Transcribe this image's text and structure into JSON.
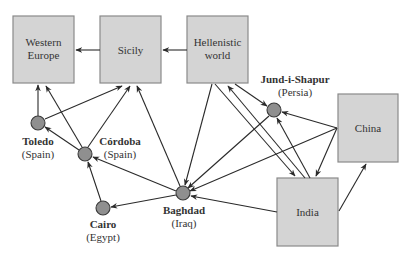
{
  "boxes": {
    "western_europe": {
      "line1": "Western",
      "line2": "Europe",
      "x": 13,
      "y": 16,
      "w": 61,
      "h": 67
    },
    "sicily": {
      "label": "Sicily",
      "x": 100,
      "y": 16,
      "w": 61,
      "h": 67
    },
    "hellenistic": {
      "line1": "Hellenistic",
      "line2": "world",
      "x": 187,
      "y": 16,
      "w": 61,
      "h": 67
    },
    "china": {
      "label": "China",
      "x": 338,
      "y": 94,
      "w": 60,
      "h": 68
    },
    "india": {
      "label": "India",
      "x": 277,
      "y": 178,
      "w": 61,
      "h": 68
    }
  },
  "hubs": {
    "toledo": {
      "name": "Toledo",
      "region": "(Spain)",
      "cx": 38,
      "cy": 123
    },
    "cordoba": {
      "name": "Córdoba",
      "region": "(Spain)",
      "cx": 85,
      "cy": 154
    },
    "cairo": {
      "name": "Cairo",
      "region": "(Egypt)",
      "cx": 103,
      "cy": 208
    },
    "baghdad": {
      "name": "Baghdad",
      "region": "(Iraq)",
      "cx": 183,
      "cy": 193
    },
    "jund": {
      "name": "Jund-i-Shapur",
      "region": "(Persia)",
      "cx": 274,
      "cy": 110
    }
  },
  "edges": [
    {
      "from": "Hellenistic world",
      "to": "Sicily",
      "x1": 187,
      "y1": 50,
      "x2": 163,
      "y2": 50
    },
    {
      "from": "Sicily",
      "to": "Western Europe",
      "x1": 100,
      "y1": 50,
      "x2": 76,
      "y2": 50
    },
    {
      "from": "Toledo",
      "to": "Western Europe",
      "x1": 38,
      "y1": 116,
      "x2": 38,
      "y2": 85
    },
    {
      "from": "Toledo",
      "to": "Sicily",
      "x1": 45,
      "y1": 119,
      "x2": 122,
      "y2": 86
    },
    {
      "from": "Córdoba",
      "to": "Western Europe",
      "x1": 82,
      "y1": 147,
      "x2": 46,
      "y2": 86
    },
    {
      "from": "Córdoba",
      "to": "Toledo",
      "x1": 79,
      "y1": 150,
      "x2": 45,
      "y2": 127
    },
    {
      "from": "Córdoba",
      "to": "Sicily",
      "x1": 88,
      "y1": 147,
      "x2": 130,
      "y2": 86
    },
    {
      "from": "Cairo",
      "to": "Córdoba",
      "x1": 101,
      "y1": 201,
      "x2": 88,
      "y2": 162
    },
    {
      "from": "Baghdad",
      "to": "Córdoba",
      "x1": 176,
      "y1": 191,
      "x2": 93,
      "y2": 157
    },
    {
      "from": "Baghdad",
      "to": "Cairo",
      "x1": 176,
      "y1": 195,
      "x2": 111,
      "y2": 207
    },
    {
      "from": "Baghdad",
      "to": "Sicily",
      "x1": 180,
      "y1": 186,
      "x2": 137,
      "y2": 86
    },
    {
      "from": "Hellenistic world",
      "to": "Baghdad",
      "x1": 212,
      "y1": 84,
      "x2": 185,
      "y2": 185
    },
    {
      "from": "Hellenistic world",
      "to": "Jund-i-Shapur",
      "x1": 235,
      "y1": 84,
      "x2": 267,
      "y2": 106
    },
    {
      "from": "Hellenistic world",
      "to": "India",
      "x1": 215,
      "y1": 84,
      "x2": 295,
      "y2": 176
    },
    {
      "from": "India",
      "to": "Hellenistic world",
      "x1": 305,
      "y1": 178,
      "x2": 228,
      "y2": 86
    },
    {
      "from": "India",
      "to": "Jund-i-Shapur",
      "x1": 310,
      "y1": 178,
      "x2": 277,
      "y2": 118
    },
    {
      "from": "Jund-i-Shapur",
      "to": "Baghdad",
      "x1": 269,
      "y1": 116,
      "x2": 188,
      "y2": 188
    },
    {
      "from": "China",
      "to": "Jund-i-Shapur",
      "x1": 337,
      "y1": 128,
      "x2": 282,
      "y2": 112
    },
    {
      "from": "China",
      "to": "Baghdad",
      "x1": 337,
      "y1": 128,
      "x2": 190,
      "y2": 191
    },
    {
      "from": "China",
      "to": "India",
      "x1": 337,
      "y1": 128,
      "x2": 316,
      "y2": 176
    },
    {
      "from": "India",
      "to": "Baghdad",
      "x1": 277,
      "y1": 212,
      "x2": 191,
      "y2": 196
    },
    {
      "from": "India",
      "to": "China",
      "x1": 339,
      "y1": 211,
      "x2": 366,
      "y2": 164
    }
  ],
  "colors": {
    "box_fill": "#d4d4d4",
    "box_stroke": "#8a8a8a",
    "hub_fill": "#8f8f8f",
    "hub_stroke": "#3a3a3a",
    "edge": "#2a2a2a"
  }
}
